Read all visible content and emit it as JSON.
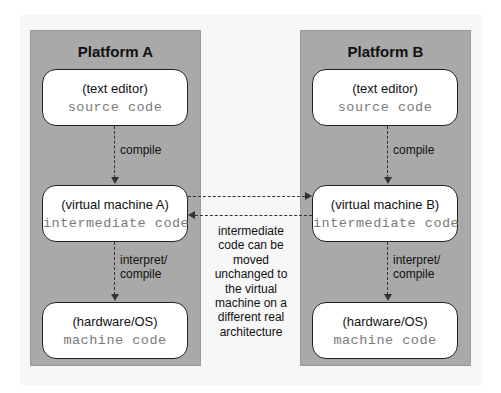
{
  "diagram": {
    "platforms": [
      {
        "title": "Platform A",
        "boxes": [
          {
            "label": "(text editor)",
            "code": "source code"
          },
          {
            "label": "(virtual machine A)",
            "code": "intermediate code"
          },
          {
            "label": "(hardware/OS)",
            "code": "machine code"
          }
        ],
        "edges": [
          {
            "from": 0,
            "to": 1,
            "label": "compile"
          },
          {
            "from": 1,
            "to": 2,
            "label_line1": "interpret/",
            "label_line2": "compile"
          }
        ]
      },
      {
        "title": "Platform B",
        "boxes": [
          {
            "label": "(text editor)",
            "code": "source code"
          },
          {
            "label": "(virtual machine B)",
            "code": "intermediate code"
          },
          {
            "label": "(hardware/OS)",
            "code": "machine code"
          }
        ],
        "edges": [
          {
            "from": 0,
            "to": 1,
            "label": "compile"
          },
          {
            "from": 1,
            "to": 2,
            "label_line1": "interpret/",
            "label_line2": "compile"
          }
        ]
      }
    ],
    "cross_edges": [
      {
        "from": "virtual machine A",
        "to": "virtual machine B",
        "style": "dashed"
      },
      {
        "from": "virtual machine B",
        "to": "virtual machine A",
        "style": "dashed"
      }
    ],
    "note": "intermediate code can be moved unchanged to the virtual machine on a different real architecture",
    "colors": {
      "panel": "#a9a9a9",
      "box": "#ffffff",
      "code_text": "#7a7a7a",
      "border": "#222222"
    }
  }
}
